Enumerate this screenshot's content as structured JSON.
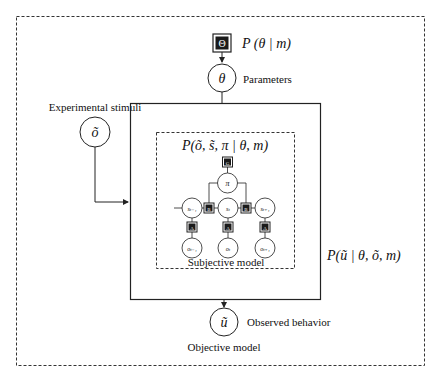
{
  "diagram": {
    "outer_box": {
      "label": "Objective model",
      "style": "dashed"
    },
    "prior": {
      "symbol": "Θ",
      "formula": "P (θ | m)"
    },
    "parameters": {
      "symbol": "θ",
      "label": "Parameters"
    },
    "stimuli": {
      "symbol": "õ",
      "label": "Experimental stimuli"
    },
    "likelihood_box": {
      "formula": "P(ũ | θ, õ, m)",
      "style": "solid"
    },
    "subjective_box": {
      "formula": "P(õ, s̃, π | θ, m)",
      "label": "Subjective model",
      "style": "dashed",
      "policy_factor_symbol": "G",
      "policy": "π",
      "states": [
        "s_{t-1}",
        "s_t",
        "s_{t+1}"
      ],
      "state_labels": [
        "sₜ₋₁",
        "sₜ",
        "sₜ₊₁"
      ],
      "transition_factor_symbol": "B",
      "likelihood_factor_symbol": "A",
      "observations": [
        "o_{t-1}",
        "o_t",
        "o_{t+1}"
      ],
      "observation_labels": [
        "oₜ₋₁",
        "oₜ",
        "oₜ₊₁"
      ]
    },
    "response": {
      "symbol": "ũ",
      "label": "Observed behavior"
    },
    "colors": {
      "line": "#222222",
      "factor_fill": "#1a1a1a",
      "background": "#ffffff"
    }
  }
}
